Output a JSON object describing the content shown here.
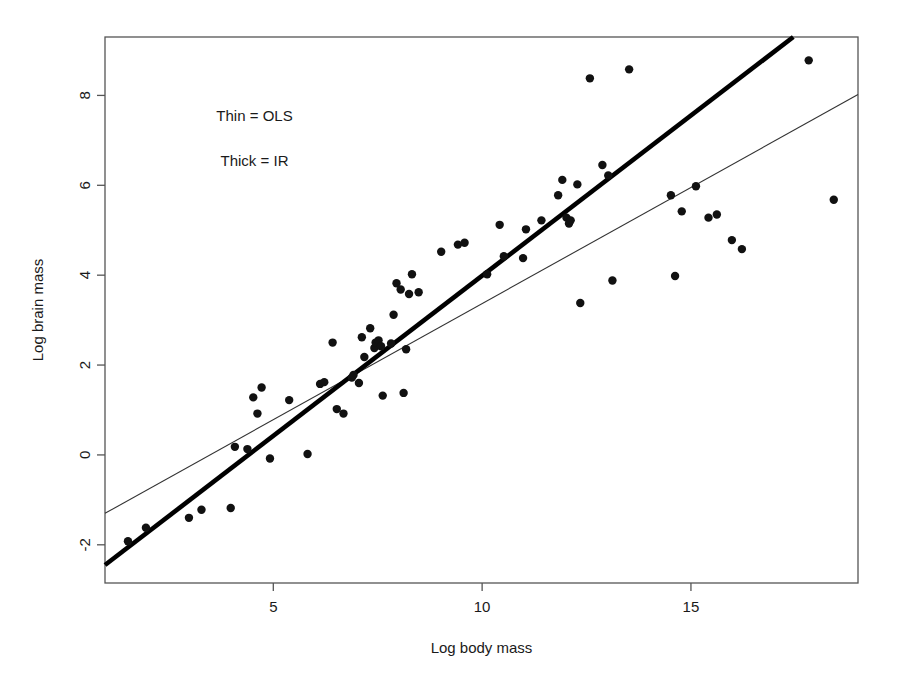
{
  "figure": {
    "width": 902,
    "height": 680,
    "background": "#ffffff",
    "plot_frame": {
      "left": 105,
      "top": 37,
      "right": 858,
      "bottom": 583,
      "color": "#555555"
    }
  },
  "chart_data": {
    "type": "scatter",
    "title": "",
    "xlabel": "Log body mass",
    "ylabel": "Log brain mass",
    "xlim": [
      0.97,
      19.0
    ],
    "ylim": [
      -2.85,
      9.3
    ],
    "xticks": [
      5,
      10,
      15
    ],
    "xtick_labels": [
      "5",
      "10",
      "15"
    ],
    "yticks": [
      -2,
      0,
      2,
      4,
      6,
      8
    ],
    "ytick_labels": [
      "-2",
      "0",
      "2",
      "4",
      "6",
      "8"
    ],
    "grid": false,
    "legend_position": "upper-left-inline",
    "point_color": "#111111",
    "point_radius": 4.2,
    "annotations": [
      {
        "text": "Thin = OLS",
        "x": 4.55,
        "y": 7.55
      },
      {
        "text": "Thick = IR",
        "x": 4.55,
        "y": 6.55
      }
    ],
    "series": [
      {
        "name": "species",
        "type": "scatter",
        "points": [
          [
            1.52,
            -1.92
          ],
          [
            1.95,
            -1.62
          ],
          [
            2.98,
            -1.4
          ],
          [
            3.28,
            -1.22
          ],
          [
            3.98,
            -1.18
          ],
          [
            4.08,
            0.18
          ],
          [
            4.38,
            0.13
          ],
          [
            4.52,
            1.28
          ],
          [
            4.62,
            0.92
          ],
          [
            4.72,
            1.5
          ],
          [
            4.92,
            -0.08
          ],
          [
            5.38,
            1.22
          ],
          [
            5.82,
            0.02
          ],
          [
            6.12,
            1.58
          ],
          [
            6.22,
            1.62
          ],
          [
            6.42,
            2.5
          ],
          [
            6.52,
            1.02
          ],
          [
            6.68,
            0.92
          ],
          [
            6.88,
            1.72
          ],
          [
            6.92,
            1.78
          ],
          [
            7.05,
            1.6
          ],
          [
            7.12,
            2.62
          ],
          [
            7.18,
            2.18
          ],
          [
            7.32,
            2.82
          ],
          [
            7.42,
            2.38
          ],
          [
            7.45,
            2.5
          ],
          [
            7.52,
            2.55
          ],
          [
            7.58,
            2.42
          ],
          [
            7.62,
            1.32
          ],
          [
            7.82,
            2.48
          ],
          [
            7.88,
            3.12
          ],
          [
            7.95,
            3.82
          ],
          [
            8.05,
            3.68
          ],
          [
            8.12,
            1.38
          ],
          [
            8.18,
            2.35
          ],
          [
            8.25,
            3.58
          ],
          [
            8.32,
            4.02
          ],
          [
            8.48,
            3.62
          ],
          [
            9.02,
            4.52
          ],
          [
            9.42,
            4.68
          ],
          [
            9.58,
            4.72
          ],
          [
            10.12,
            4.02
          ],
          [
            10.42,
            5.12
          ],
          [
            10.52,
            4.42
          ],
          [
            10.98,
            4.38
          ],
          [
            11.05,
            5.02
          ],
          [
            11.42,
            5.22
          ],
          [
            11.82,
            5.78
          ],
          [
            11.92,
            6.12
          ],
          [
            12.02,
            5.28
          ],
          [
            12.08,
            5.15
          ],
          [
            12.12,
            5.22
          ],
          [
            12.28,
            6.02
          ],
          [
            12.35,
            3.38
          ],
          [
            12.58,
            8.38
          ],
          [
            12.88,
            6.45
          ],
          [
            13.02,
            6.22
          ],
          [
            13.12,
            3.88
          ],
          [
            13.52,
            8.58
          ],
          [
            14.52,
            5.78
          ],
          [
            14.62,
            3.98
          ],
          [
            14.78,
            5.42
          ],
          [
            15.12,
            5.98
          ],
          [
            15.42,
            5.28
          ],
          [
            15.62,
            5.35
          ],
          [
            15.98,
            4.78
          ],
          [
            16.22,
            4.58
          ],
          [
            17.82,
            8.78
          ],
          [
            18.42,
            5.68
          ]
        ]
      },
      {
        "name": "Thin = OLS",
        "type": "line",
        "style": "thin",
        "width": 1.1,
        "color": "#333333",
        "endpoints": [
          [
            0.97,
            -1.3
          ],
          [
            19.0,
            8.02
          ]
        ]
      },
      {
        "name": "Thick = IR",
        "type": "line",
        "style": "thick",
        "width": 4.6,
        "color": "#000000",
        "endpoints": [
          [
            0.97,
            -2.45
          ],
          [
            17.45,
            9.3
          ]
        ]
      }
    ]
  }
}
